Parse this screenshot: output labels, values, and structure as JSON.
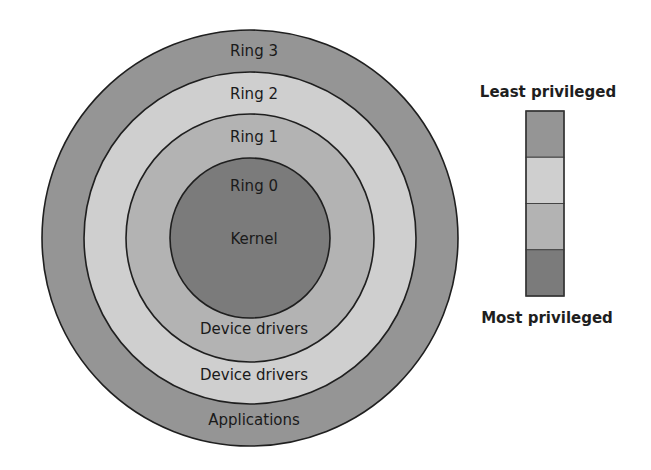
{
  "diagram": {
    "rings": [
      {
        "id": "ring3",
        "name": "Ring 3",
        "role": "Applications",
        "color": "#959595"
      },
      {
        "id": "ring2",
        "name": "Ring 2",
        "role": "Device drivers",
        "color": "#cfcfcf"
      },
      {
        "id": "ring1",
        "name": "Ring 1",
        "role": "Device drivers",
        "color": "#b3b3b3"
      },
      {
        "id": "ring0",
        "name": "Ring 0",
        "role": "Kernel",
        "color": "#7b7b7b"
      }
    ],
    "legend": {
      "top_label": "Least privileged",
      "bottom_label": "Most privileged",
      "order_top_to_bottom": [
        "ring3",
        "ring2",
        "ring1",
        "ring0"
      ]
    }
  }
}
